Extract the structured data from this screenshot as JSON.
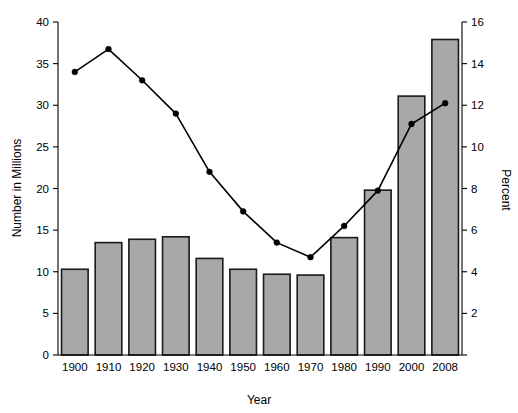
{
  "chart_data": {
    "type": "bar",
    "title": "",
    "subtitle": "",
    "xlabel": "Year",
    "ylabel": "Number in Millions",
    "y2label": "Percent",
    "categories": [
      "1900",
      "1910",
      "1920",
      "1930",
      "1940",
      "1950",
      "1960",
      "1970",
      "1980",
      "1990",
      "2000",
      "2008"
    ],
    "ylim": [
      0,
      40
    ],
    "y2lim": [
      0,
      16
    ],
    "yticks": [
      0,
      5,
      10,
      15,
      20,
      25,
      30,
      35,
      40
    ],
    "y2ticks": [
      0,
      2,
      4,
      6,
      8,
      10,
      12,
      14,
      16
    ],
    "ytick_labels": [
      "0",
      "5",
      "10",
      "15",
      "20",
      "25",
      "30",
      "35",
      "40"
    ],
    "y2tick_labels": [
      "0",
      "2",
      "4",
      "6",
      "8",
      "10",
      "12",
      "14",
      "16"
    ],
    "grid": false,
    "legend": "none",
    "series": [
      {
        "name": "Number in Millions",
        "type": "bar",
        "axis": "left",
        "color": "#a8a8a8",
        "edge_color": "#1a1a1a",
        "values": [
          10.3,
          13.5,
          13.9,
          14.2,
          11.6,
          10.3,
          9.7,
          9.6,
          14.1,
          19.8,
          31.1,
          37.9
        ]
      },
      {
        "name": "Percent",
        "type": "line",
        "axis": "right",
        "color": "#000000",
        "marker": "filled-circle",
        "values": [
          13.6,
          14.7,
          13.2,
          11.6,
          8.8,
          6.9,
          5.4,
          4.7,
          6.2,
          7.9,
          11.1,
          12.1
        ]
      }
    ]
  },
  "colors": {
    "bar_fill": "#a8a8a8",
    "bar_edge": "#1a1a1a",
    "line": "#000000",
    "axis": "#000000",
    "background": "#ffffff"
  }
}
